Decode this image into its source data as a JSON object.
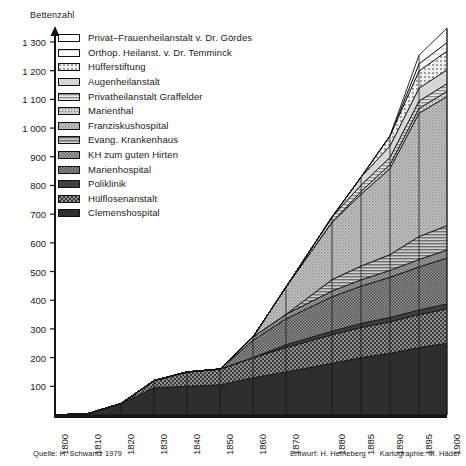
{
  "meta": {
    "axis_title": "Bettenzahl",
    "footer_source": "Quelle: H. Schwantz 1979",
    "footer_design": "Entwurf: H. Heineberg",
    "footer_cartography": "Kartographie: M. Häder"
  },
  "chart_data": {
    "type": "area",
    "title": "",
    "subtitle": "",
    "xlabel": "",
    "ylabel": "Bettenzahl",
    "ylim": [
      0,
      1300
    ],
    "xlim": [
      1800,
      1900
    ],
    "grid": false,
    "legend_position": "top-left",
    "stacked": true,
    "stack_order_top_to_bottom": true,
    "x": [
      1800,
      1810,
      1820,
      1830,
      1840,
      1850,
      1860,
      1870,
      1880,
      1885,
      1890,
      1895,
      1900
    ],
    "xtick_labels": [
      "1800",
      "1810",
      "1820",
      "1830",
      "1840",
      "1850",
      "1860",
      "1870",
      "1880",
      "1885",
      "1890",
      "1895",
      "1900"
    ],
    "ytick_labels": [
      "100",
      "200",
      "300",
      "400",
      "500",
      "600",
      "700",
      "800",
      "900",
      "1 000",
      "1 100",
      "1 200",
      "1 300"
    ],
    "ytick_values": [
      100,
      200,
      300,
      400,
      500,
      600,
      700,
      800,
      900,
      1000,
      1100,
      1200,
      1300
    ],
    "series": [
      {
        "name": "Privat–Frauenheilanstalt v. Dr. Gördes",
        "pattern": "blank",
        "fill": "#ffffff",
        "values": [
          0,
          0,
          0,
          0,
          0,
          0,
          0,
          0,
          0,
          0,
          0,
          30,
          50
        ]
      },
      {
        "name": "Orthop. Heilanst. v. Dr. Temminck",
        "pattern": "very-light",
        "fill": "#f2f2f2",
        "values": [
          0,
          0,
          0,
          0,
          0,
          0,
          0,
          0,
          0,
          0,
          0,
          25,
          30
        ]
      },
      {
        "name": "Hüfferstiftung",
        "pattern": "dots-light",
        "fill": "#e3e3e3",
        "values": [
          0,
          0,
          0,
          0,
          0,
          0,
          0,
          0,
          0,
          0,
          35,
          60,
          65
        ]
      },
      {
        "name": "Augenheilanstalt",
        "pattern": "light-grey",
        "fill": "#d2d2d2",
        "values": [
          0,
          0,
          0,
          0,
          0,
          0,
          0,
          0,
          0,
          28,
          40,
          45,
          48
        ]
      },
      {
        "name": "Privatheilanstalt Graffelder",
        "pattern": "hlines",
        "fill": "#c4c4c4",
        "values": [
          0,
          0,
          0,
          0,
          0,
          0,
          0,
          0,
          18,
          22,
          25,
          26,
          27
        ]
      },
      {
        "name": "Marienthal",
        "pattern": "fine-dots",
        "fill": "#bdbdbd",
        "values": [
          0,
          0,
          0,
          0,
          0,
          0,
          0,
          0,
          0,
          10,
          14,
          16,
          18
        ]
      },
      {
        "name": "Franziskushospital",
        "pattern": "mid-dots",
        "fill": "#aaaaaa",
        "values": [
          0,
          0,
          0,
          0,
          0,
          0,
          0,
          95,
          200,
          250,
          300,
          430,
          450
        ]
      },
      {
        "name": "Evang. Krankenhaus",
        "pattern": "hlines-dark",
        "fill": "#9a9a9a",
        "values": [
          0,
          0,
          0,
          0,
          0,
          0,
          0,
          0,
          40,
          48,
          55,
          80,
          85
        ]
      },
      {
        "name": "KH zum guten Hirten",
        "pattern": "checker",
        "fill": "#8a8a8a",
        "values": [
          0,
          0,
          0,
          0,
          0,
          0,
          12,
          16,
          20,
          22,
          24,
          26,
          28
        ]
      },
      {
        "name": "Marienhospital",
        "pattern": "checker-dark",
        "fill": "#757575",
        "values": [
          0,
          0,
          0,
          0,
          0,
          0,
          60,
          90,
          120,
          130,
          140,
          150,
          160
        ]
      },
      {
        "name": "Poliklinik",
        "pattern": "solid-dark",
        "fill": "#4a4a4a",
        "values": [
          0,
          0,
          0,
          0,
          0,
          0,
          0,
          10,
          12,
          14,
          15,
          16,
          17
        ]
      },
      {
        "name": "Hülflosenanstalt",
        "pattern": "coarse-checker",
        "fill": "#5f5f5f",
        "values": [
          0,
          0,
          0,
          25,
          50,
          55,
          70,
          85,
          100,
          105,
          110,
          115,
          120
        ]
      },
      {
        "name": "Clemenshospital",
        "pattern": "solid-darkest",
        "fill": "#333333",
        "values": [
          0,
          5,
          40,
          95,
          100,
          105,
          130,
          150,
          180,
          200,
          215,
          235,
          250
        ]
      }
    ]
  }
}
